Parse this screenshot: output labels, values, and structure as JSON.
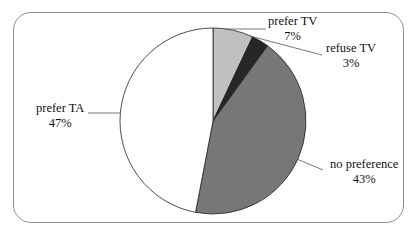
{
  "chart_data": {
    "type": "pie",
    "title": "",
    "start_angle": "12 o'clock, clockwise",
    "categories": [
      "prefer TV",
      "refuse TV",
      "no preference",
      "prefer TA"
    ],
    "values": [
      7,
      3,
      43,
      47
    ],
    "value_labels": [
      "7%",
      "3%",
      "43%",
      "47%"
    ],
    "colors": [
      "#c0c0c0",
      "#262626",
      "#777777",
      "#ffffff"
    ],
    "legend": "none (data labels with leader lines)"
  },
  "labels": {
    "prefer_tv": {
      "name": "prefer TV",
      "pct": "7%"
    },
    "refuse_tv": {
      "name": "refuse TV",
      "pct": "3%"
    },
    "no_preference": {
      "name": "no preference",
      "pct": "43%"
    },
    "prefer_ta": {
      "name": "prefer TA",
      "pct": "47%"
    }
  }
}
